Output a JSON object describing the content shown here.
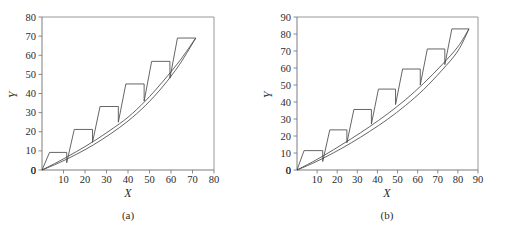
{
  "figure": {
    "background": "#ffffff",
    "line_color": "#3d3d3d",
    "frame_color": "#8c8c8c"
  },
  "panels": [
    {
      "caption": "(a)",
      "xlabel": "X",
      "ylabel": "Y"
    },
    {
      "caption": "(b)",
      "xlabel": "X",
      "ylabel": "Y"
    }
  ],
  "chart_data": [
    {
      "type": "line",
      "title": "",
      "subtitle": "",
      "caption": "(a)",
      "xlabel": "X",
      "ylabel": "Y",
      "xlim": [
        0,
        80
      ],
      "ylim": [
        0,
        80
      ],
      "xticks": [
        0,
        10,
        20,
        30,
        40,
        50,
        60,
        70,
        80
      ],
      "yticks": [
        0,
        10,
        20,
        30,
        40,
        50,
        60,
        70,
        80
      ],
      "xtick_labels": [
        "0",
        "10",
        "20",
        "30",
        "40",
        "50",
        "60",
        "70",
        "80"
      ],
      "ytick_labels": [
        "0",
        "10",
        "20",
        "30",
        "40",
        "50",
        "60",
        "70",
        "80"
      ],
      "grid": false,
      "legend": "none",
      "series": [
        {
          "name": "staircase",
          "type": "step-sawtooth",
          "points": [
            [
              0,
              0
            ],
            [
              3.5,
              9.2
            ],
            [
              11.5,
              9.2
            ],
            [
              11.5,
              3.8
            ],
            [
              15.0,
              21.2
            ],
            [
              23.5,
              21.2
            ],
            [
              23.5,
              14.5
            ],
            [
              27.0,
              33.2
            ],
            [
              35.5,
              33.2
            ],
            [
              35.5,
              25.0
            ],
            [
              39.0,
              45.0
            ],
            [
              47.5,
              45.0
            ],
            [
              47.5,
              36.0
            ],
            [
              51.0,
              56.8
            ],
            [
              59.5,
              56.8
            ],
            [
              59.5,
              48.0
            ],
            [
              63.0,
              69.0
            ],
            [
              71.5,
              69.0
            ]
          ]
        },
        {
          "name": "upper-curve",
          "type": "curve",
          "x": [
            0,
            8,
            16,
            24,
            32,
            40,
            48,
            56,
            64,
            71.5
          ],
          "y": [
            0,
            4.6,
            9.6,
            15.0,
            21.0,
            27.6,
            36.0,
            46.0,
            57.0,
            69.0
          ]
        },
        {
          "name": "lower-curve",
          "type": "curve",
          "x": [
            0,
            8,
            16,
            24,
            32,
            40,
            48,
            56,
            64,
            71.5
          ],
          "y": [
            0,
            3.8,
            8.2,
            13.2,
            19.0,
            25.6,
            33.6,
            43.4,
            55.2,
            69.0
          ]
        }
      ]
    },
    {
      "type": "line",
      "title": "",
      "subtitle": "",
      "caption": "(b)",
      "xlabel": "X",
      "ylabel": "Y",
      "xlim": [
        0,
        90
      ],
      "ylim": [
        0,
        90
      ],
      "xticks": [
        0,
        10,
        20,
        30,
        40,
        50,
        60,
        70,
        80,
        90
      ],
      "yticks": [
        0,
        10,
        20,
        30,
        40,
        50,
        60,
        70,
        80,
        90
      ],
      "xtick_labels": [
        "0",
        "10",
        "20",
        "30",
        "40",
        "50",
        "60",
        "70",
        "80",
        "90"
      ],
      "ytick_labels": [
        "0",
        "10",
        "20",
        "30",
        "40",
        "50",
        "60",
        "70",
        "80",
        "90"
      ],
      "grid": false,
      "legend": "none",
      "series": [
        {
          "name": "staircase",
          "type": "step-sawtooth",
          "points": [
            [
              0,
              0
            ],
            [
              3.5,
              11.4
            ],
            [
              12.8,
              11.4
            ],
            [
              12.8,
              5.0
            ],
            [
              16.3,
              23.6
            ],
            [
              24.8,
              23.6
            ],
            [
              24.8,
              16.0
            ],
            [
              28.3,
              35.6
            ],
            [
              37.0,
              35.6
            ],
            [
              37.0,
              27.0
            ],
            [
              40.5,
              47.6
            ],
            [
              49.0,
              47.6
            ],
            [
              49.0,
              38.5
            ],
            [
              52.5,
              59.4
            ],
            [
              61.3,
              59.4
            ],
            [
              61.3,
              50.0
            ],
            [
              64.8,
              71.2
            ],
            [
              73.5,
              71.2
            ],
            [
              73.5,
              62.0
            ],
            [
              77.0,
              83.0
            ],
            [
              85.5,
              83.0
            ]
          ]
        },
        {
          "name": "upper-curve",
          "type": "curve",
          "x": [
            0,
            9,
            18,
            27,
            36,
            45,
            54,
            63,
            72,
            80,
            85.5
          ],
          "y": [
            0,
            5.6,
            11.8,
            18.4,
            25.4,
            33.0,
            41.4,
            51.0,
            61.8,
            72.5,
            83.0
          ]
        },
        {
          "name": "lower-curve",
          "type": "curve",
          "x": [
            0,
            9,
            18,
            27,
            36,
            45,
            54,
            63,
            72,
            80,
            85.5
          ],
          "y": [
            0,
            4.6,
            10.0,
            16.0,
            22.6,
            29.8,
            38.0,
            47.4,
            58.6,
            70.0,
            83.0
          ]
        }
      ]
    }
  ]
}
